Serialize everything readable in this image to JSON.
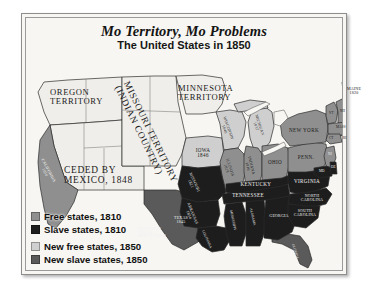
{
  "figure": {
    "title": "Mo Territory, Mo Problems",
    "subtitle": "The United States in 1850"
  },
  "colors": {
    "background": "#f7f6f2",
    "free_1810": "#8f8f8f",
    "slave_1810": "#1d1d1d",
    "new_free_1850": "#cfcfcf",
    "new_slave_1850": "#5a5a5a",
    "territory": "#efeeea",
    "outline": "#2b2b2b"
  },
  "legend": {
    "items": [
      {
        "label": "Free states, 1810",
        "color": "#8f8f8f"
      },
      {
        "label": "Slave states, 1810",
        "color": "#1d1d1d"
      },
      {
        "label": "New free states, 1850",
        "color": "#cfcfcf"
      },
      {
        "label": "New slave states, 1850",
        "color": "#5a5a5a"
      }
    ]
  },
  "territories": [
    {
      "name": "oregon-territory",
      "line1": "OREGON",
      "line2": "TERRITORY"
    },
    {
      "name": "missouri-territory",
      "line1": "MISSOURI TERRITORY",
      "line2": "(INDIAN COUNTRY)"
    },
    {
      "name": "minnesota-territory",
      "line1": "MINNESOTA",
      "line2": "TERRITORY"
    },
    {
      "name": "mexican-cession",
      "line1": "CEDED BY",
      "line2": "MEXICO, 1848"
    },
    {
      "name": "disputed-area",
      "line1": "DISPUTED BY",
      "line2": "TEXAS &",
      "line3": "MEXICO, 1836-48"
    }
  ],
  "states": {
    "california": {
      "label": "CALIFORNIA",
      "year": "1850"
    },
    "iowa": {
      "label": "IOWA",
      "year": "1846"
    },
    "wisconsin": {
      "label": "WISCONSIN",
      "year": "1848"
    },
    "michigan": {
      "label": "MICHIGAN",
      "year": "1837"
    },
    "illinois": {
      "label": "ILLINOIS",
      "year": "1818"
    },
    "indiana": {
      "label": "INDIANA",
      "year": "1816"
    },
    "ohio": {
      "label": "OHIO",
      "year": ""
    },
    "missouri": {
      "label": "MISSOURI",
      "year": "1821"
    },
    "arkansas": {
      "label": "ARKANSAS",
      "year": "1836"
    },
    "texas": {
      "label": "TEXAS",
      "year": "1845"
    },
    "louisiana": {
      "label": "LOUISIANA",
      "year": ""
    },
    "mississippi": {
      "label": "MISSISSIPPI",
      "year": ""
    },
    "alabama": {
      "label": "ALABAMA",
      "year": ""
    },
    "georgia": {
      "label": "GEORGIA",
      "year": ""
    },
    "florida": {
      "label": "FLORIDA",
      "year": ""
    },
    "tennessee": {
      "label": "TENNESSEE",
      "year": ""
    },
    "kentucky": {
      "label": "KENTUCKY",
      "year": ""
    },
    "virginia": {
      "label": "VIRGINIA",
      "year": ""
    },
    "north_carolina": {
      "label": "NORTH",
      "label2": "CAROLINA"
    },
    "south_carolina": {
      "label": "SOUTH",
      "label2": "CAROLINA"
    },
    "pennsylvania": {
      "label": "PENN.",
      "year": ""
    },
    "new_york": {
      "label": "NEW YORK",
      "year": ""
    },
    "maine": {
      "label": "MAINE",
      "year": "1820"
    },
    "vermont": {
      "label": "VT",
      "year": ""
    },
    "new_hampshire": {
      "label": "NH",
      "year": ""
    },
    "massachusetts": {
      "label": "MASS",
      "year": ""
    },
    "connecticut": {
      "label": "CT",
      "year": ""
    },
    "rhode_island": {
      "label": "RI",
      "year": ""
    },
    "new_jersey": {
      "label": "NJ",
      "year": ""
    },
    "maryland": {
      "label": "MD",
      "year": ""
    },
    "delaware": {
      "label": "DE",
      "year": ""
    }
  }
}
